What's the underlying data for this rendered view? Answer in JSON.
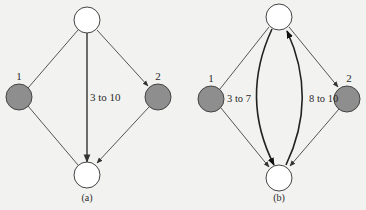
{
  "colors": {
    "background": "#f2f2f0",
    "edge": "#555555",
    "bold_edge": "#222222",
    "node_fill_white": "#ffffff",
    "node_fill_gray": "#8e8e8e",
    "node_stroke": "#444444"
  },
  "diagrams": [
    {
      "id": "a",
      "caption": "(a)",
      "nodes": [
        {
          "id": "top",
          "label": "",
          "fill": "white"
        },
        {
          "id": "left",
          "label": "1",
          "fill": "gray"
        },
        {
          "id": "right",
          "label": "2",
          "fill": "gray"
        },
        {
          "id": "bottom",
          "label": "",
          "fill": "white"
        }
      ],
      "edges": [
        {
          "from": "top",
          "to": "left",
          "directed": false
        },
        {
          "from": "top",
          "to": "right",
          "directed": true
        },
        {
          "from": "top",
          "to": "bottom",
          "directed": true,
          "label": "3 to 10"
        },
        {
          "from": "left",
          "to": "bottom",
          "directed": false
        },
        {
          "from": "right",
          "to": "bottom",
          "directed": true
        }
      ],
      "edge_labels": {
        "center": "3 to 10"
      }
    },
    {
      "id": "b",
      "caption": "(b)",
      "nodes": [
        {
          "id": "top",
          "label": "",
          "fill": "white"
        },
        {
          "id": "left",
          "label": "1",
          "fill": "gray"
        },
        {
          "id": "right",
          "label": "2",
          "fill": "gray"
        },
        {
          "id": "bottom",
          "label": "",
          "fill": "white"
        }
      ],
      "edges": [
        {
          "from": "top",
          "to": "left",
          "directed": false
        },
        {
          "from": "top",
          "to": "right",
          "directed": true
        },
        {
          "from": "top",
          "to": "bottom",
          "directed": true,
          "curved": "left",
          "label": "3 to 7"
        },
        {
          "from": "bottom",
          "to": "top",
          "directed": true,
          "curved": "right",
          "label": "8 to 10"
        },
        {
          "from": "left",
          "to": "bottom",
          "directed": true
        },
        {
          "from": "right",
          "to": "bottom",
          "directed": true
        }
      ],
      "edge_labels": {
        "left_arc": "3 to 7",
        "right_arc": "8 to 10"
      }
    }
  ]
}
